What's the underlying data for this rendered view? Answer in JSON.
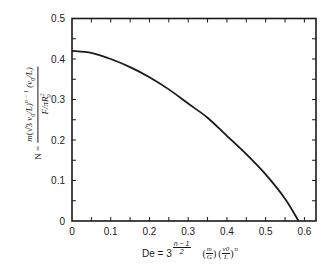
{
  "chart_data": {
    "type": "line",
    "title": "",
    "xlabel": "De = 3^((n-1)/2) (m/G) (v0/L)^n",
    "ylabel": "N = m(√3 v0/L)^(n-1) (v0/L) / (F/πR0^2)",
    "xlim": [
      0,
      0.63
    ],
    "ylim": [
      0,
      0.5
    ],
    "grid": false,
    "legend": null,
    "x_ticks": [
      "0",
      "0.1",
      "0.2",
      "0.3",
      "0.4",
      "0.5",
      "0.6"
    ],
    "y_ticks": [
      "0",
      "0.1",
      "0.2",
      "0.3",
      "0.4",
      "0.5"
    ],
    "series": [
      {
        "name": "N vs De",
        "x": [
          0,
          0.05,
          0.1,
          0.15,
          0.2,
          0.25,
          0.3,
          0.35,
          0.4,
          0.45,
          0.5,
          0.55,
          0.585
        ],
        "y": [
          0.42,
          0.415,
          0.4,
          0.38,
          0.355,
          0.325,
          0.29,
          0.255,
          0.21,
          0.165,
          0.115,
          0.055,
          0.0
        ]
      }
    ]
  },
  "labels": {
    "y": {
      "lhs": "N =",
      "num_m": "m",
      "num_sqrt": "√3",
      "num_v0L": "v",
      "num_sub0": "0",
      "num_L": "/L)",
      "num_exp": "n − 1",
      "num_tail": "(v",
      "num_tail_sub": "0",
      "num_tail_end": "/L)",
      "den": "F/πR",
      "den_sub": "0",
      "den_sup": "2"
    },
    "x": {
      "lhs": "De = 3",
      "exp": "n − 1",
      "exp_den": "2",
      "f1_num": "m",
      "f1_den": "G",
      "f2_num": "v0",
      "f2_den": "L",
      "f2_exp": "n"
    }
  }
}
